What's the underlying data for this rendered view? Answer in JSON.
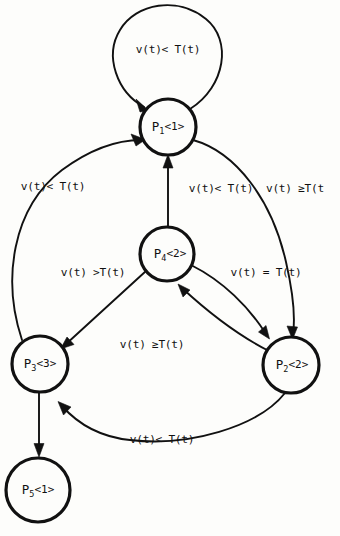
{
  "diagram": {
    "background_color": "#fdfdfb",
    "ink_color": "#111111",
    "width": 340,
    "height": 536,
    "nodes": [
      {
        "id": "p1",
        "name": "P",
        "subscript": "1",
        "marking": "<1>",
        "label": "P1<1>",
        "cx": 168,
        "cy": 127,
        "r": 28
      },
      {
        "id": "p4",
        "name": "P",
        "subscript": "4",
        "marking": "<2>",
        "label": "P4<2>",
        "cx": 167,
        "cy": 254,
        "r": 27
      },
      {
        "id": "p3",
        "name": "P",
        "subscript": "3",
        "marking": "<3>",
        "label": "P3<3>",
        "cx": 40,
        "cy": 364,
        "r": 28
      },
      {
        "id": "p2",
        "name": "P",
        "subscript": "2",
        "marking": "<2>",
        "label": "P2<2>",
        "cx": 291,
        "cy": 365,
        "r": 28
      },
      {
        "id": "p5",
        "name": "P",
        "subscript": "5",
        "marking": "<1>",
        "label": "P5<1>",
        "cx": 38,
        "cy": 490,
        "r": 32
      }
    ],
    "edges": [
      {
        "id": "e-self-p1",
        "from": "p1",
        "to": "p1",
        "label": "v(t)< T(t)",
        "label_x": 168,
        "label_y": 49
      },
      {
        "id": "e-p3-p1",
        "from": "p3",
        "to": "p1",
        "label": "v(t)< T(t)",
        "label_x": 53,
        "label_y": 186
      },
      {
        "id": "e-p4-p1",
        "from": "p4",
        "to": "p1",
        "label": "v(t)< T(t)",
        "label_x": 221,
        "label_y": 188
      },
      {
        "id": "e-p1-p2",
        "from": "p1",
        "to": "p2",
        "label": "v(t) ≥T(t",
        "label_x": 303,
        "label_y": 188
      },
      {
        "id": "e-p4-p3",
        "from": "p4",
        "to": "p3",
        "label": "v(t) >T(t)",
        "label_x": 93,
        "label_y": 272
      },
      {
        "id": "e-p4-p2",
        "from": "p4",
        "to": "p2",
        "label": "v(t) = T(t)",
        "label_x": 266,
        "label_y": 272
      },
      {
        "id": "e-p2-p4",
        "from": "p2",
        "to": "p4",
        "label": "v(t) ≥T(t)",
        "label_x": 152,
        "label_y": 344
      },
      {
        "id": "e-p2-p3",
        "from": "p2",
        "to": "p3",
        "label": "v(t)< T(t)",
        "label_x": 162,
        "label_y": 439
      },
      {
        "id": "e-p3-p5",
        "from": "p3",
        "to": "p5",
        "label": "",
        "label_x": 0,
        "label_y": 0
      }
    ]
  }
}
